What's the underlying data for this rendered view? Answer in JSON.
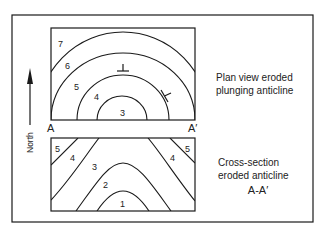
{
  "figure": {
    "plan_view": {
      "caption_lines": [
        "Plan view eroded",
        "plunging anticline"
      ],
      "unit_labels": [
        "7",
        "6",
        "5",
        "4",
        "3"
      ],
      "symbols": [
        "strike-dip-symbol-north",
        "strike-dip-symbol-east"
      ]
    },
    "cross_section": {
      "caption_lines": [
        "Cross-section",
        "eroded anticline",
        "A-A′"
      ],
      "unit_labels_left": [
        "5",
        "4",
        "3",
        "2",
        "1"
      ],
      "unit_labels_right": [
        "4",
        "5"
      ]
    },
    "section_line": {
      "start_label": "A",
      "end_label": "A′"
    },
    "north_arrow": {
      "label": "North"
    },
    "colors": {
      "line": "#1a1a1a",
      "background": "#ffffff"
    }
  }
}
